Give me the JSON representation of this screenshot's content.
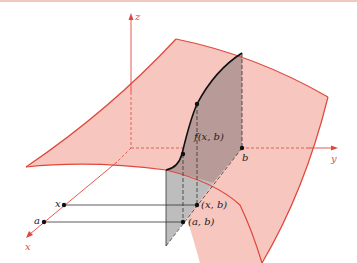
{
  "figure": {
    "colors": {
      "surface_fill": "#f6c6bf",
      "surface_edge": "#e0473c",
      "axis": "#e0473c",
      "plane_fill": "#b9b9b9",
      "plane_overlap": "#b89a98",
      "curve": "#111111"
    },
    "axes": {
      "z_label": "z",
      "y_label": "y",
      "x_label": "x"
    },
    "labels": {
      "b": "b",
      "f_xb": "f(x, b)",
      "x_point": "x",
      "a_point": "a",
      "xb_point": "(x, b)",
      "ab_point": "(a, b)"
    }
  }
}
